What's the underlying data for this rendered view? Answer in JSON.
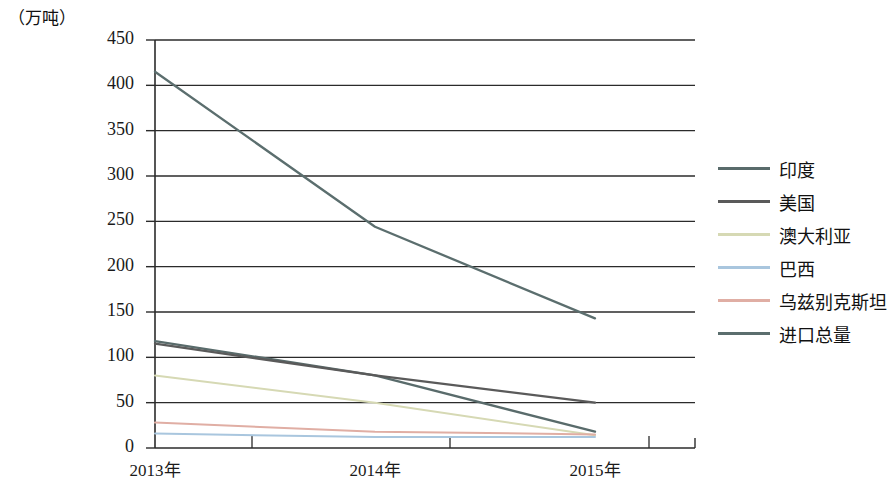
{
  "chart_data": {
    "type": "line",
    "title": "",
    "subtitle": "",
    "unit_label": "（万吨）",
    "xlabel": "",
    "ylabel": "",
    "categories": [
      "2013年",
      "2014年",
      "2015年"
    ],
    "ylim": [
      0,
      450
    ],
    "ytick_step": 50,
    "yticks": [
      "0",
      "50",
      "100",
      "150",
      "200",
      "250",
      "300",
      "350",
      "400",
      "450"
    ],
    "grid": "horizontal",
    "legend_position": "right",
    "series": [
      {
        "name": "印度",
        "values": [
          118,
          80,
          18
        ],
        "color": "#596b6b"
      },
      {
        "name": "美国",
        "values": [
          115,
          80,
          50
        ],
        "color": "#5a5a5a"
      },
      {
        "name": "澳大利亚",
        "values": [
          80,
          50,
          14
        ],
        "color": "#d6d9b4"
      },
      {
        "name": "巴西",
        "values": [
          16,
          12,
          12
        ],
        "color": "#a9c6de"
      },
      {
        "name": "乌兹别克斯坦",
        "values": [
          28,
          18,
          15
        ],
        "color": "#e0aea4"
      },
      {
        "name": "进口总量",
        "values": [
          415,
          244,
          143
        ],
        "color": "#5b6e6e"
      }
    ]
  },
  "axis": {
    "unit": "（万吨）",
    "x_labels": [
      "2013年",
      "2014年",
      "2015年"
    ],
    "y_labels": [
      "450",
      "400",
      "350",
      "300",
      "250",
      "200",
      "150",
      "100",
      "50",
      "0"
    ]
  },
  "legend": {
    "items": [
      {
        "label": "印度"
      },
      {
        "label": "美国"
      },
      {
        "label": "澳大利亚"
      },
      {
        "label": "巴西"
      },
      {
        "label": "乌兹别克斯坦"
      },
      {
        "label": "进口总量"
      }
    ]
  }
}
